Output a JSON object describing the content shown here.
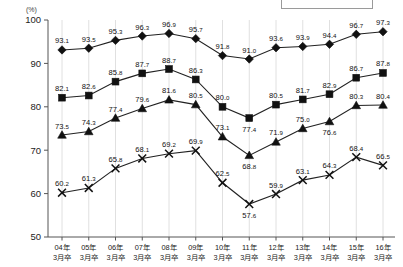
{
  "chart_data": {
    "type": "line",
    "title": "",
    "subtitle": "",
    "xlabel": "",
    "ylabel": "(%)",
    "unit_label": "(%)",
    "ylim": [
      50,
      100
    ],
    "ytick_values": [
      "50",
      "60",
      "70",
      "80",
      "90",
      "100"
    ],
    "grid": true,
    "legend_position": "top-right",
    "legend_entries": [],
    "categories": [
      "04年\n3月卒",
      "05年\n3月卒",
      "06年\n3月卒",
      "07年\n3月卒",
      "08年\n3月卒",
      "09年\n3月卒",
      "10年\n3月卒",
      "11年\n3月卒",
      "12年\n3月卒",
      "13年\n3月卒",
      "14年\n3月卒",
      "15年\n3月卒",
      "16年\n3月卒"
    ],
    "category_lines": [
      [
        "04年",
        "3月卒"
      ],
      [
        "05年",
        "3月卒"
      ],
      [
        "06年",
        "3月卒"
      ],
      [
        "07年",
        "3月卒"
      ],
      [
        "08年",
        "3月卒"
      ],
      [
        "09年",
        "3月卒"
      ],
      [
        "10年",
        "3月卒"
      ],
      [
        "11年",
        "3月卒"
      ],
      [
        "12年",
        "3月卒"
      ],
      [
        "13年",
        "3月卒"
      ],
      [
        "14年",
        "3月卒"
      ],
      [
        "15年",
        "3月卒"
      ],
      [
        "16年",
        "3月卒"
      ]
    ],
    "series": [
      {
        "name": "series-diamond",
        "marker": "diamond",
        "color": "#111111",
        "values": [
          93.1,
          93.5,
          95.3,
          96.3,
          96.9,
          95.7,
          91.8,
          91.0,
          93.6,
          93.9,
          94.4,
          96.7,
          97.3
        ],
        "label_positions": [
          "above",
          "above",
          "above",
          "above",
          "above",
          "above",
          "above",
          "above",
          "above",
          "above",
          "above",
          "above",
          "above"
        ]
      },
      {
        "name": "series-square",
        "marker": "square",
        "color": "#111111",
        "values": [
          82.1,
          82.6,
          85.8,
          87.7,
          88.7,
          86.3,
          80.0,
          77.4,
          80.5,
          81.7,
          82.9,
          86.7,
          87.8
        ],
        "label_positions": [
          "above",
          "above",
          "above",
          "above",
          "above",
          "above",
          "above",
          "below",
          "above",
          "above",
          "above",
          "above",
          "above"
        ]
      },
      {
        "name": "series-triangle",
        "marker": "triangle",
        "color": "#111111",
        "values": [
          73.5,
          74.3,
          77.4,
          79.6,
          81.6,
          80.5,
          73.1,
          68.8,
          71.9,
          75.0,
          76.6,
          80.3,
          80.4
        ],
        "label_positions": [
          "above",
          "above",
          "above",
          "above",
          "above",
          "above",
          "above",
          "below",
          "above",
          "above",
          "below",
          "above",
          "above"
        ]
      },
      {
        "name": "series-cross",
        "marker": "cross",
        "color": "#111111",
        "values": [
          60.2,
          61.3,
          65.8,
          68.1,
          69.2,
          69.9,
          62.5,
          57.6,
          59.9,
          63.1,
          64.3,
          68.4,
          66.5
        ],
        "label_positions": [
          "above",
          "above",
          "above",
          "above",
          "above",
          "above",
          "above",
          "below",
          "above",
          "above",
          "above",
          "above",
          "above"
        ]
      }
    ]
  }
}
